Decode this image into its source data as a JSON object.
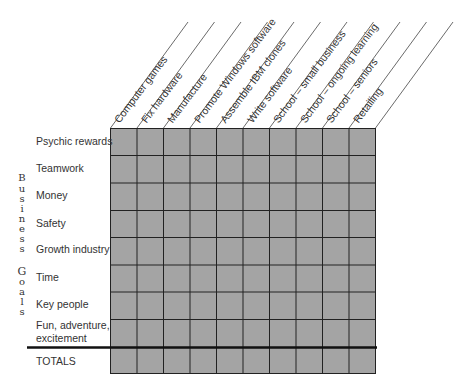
{
  "columns": [
    {
      "label": "Computer games"
    },
    {
      "label": "Fix hardware"
    },
    {
      "label": "Manufacture"
    },
    {
      "label": "Promote Windows software"
    },
    {
      "label": "Assemble IBM clones"
    },
    {
      "label": "Write software"
    },
    {
      "label": "School – small business"
    },
    {
      "label": "School – ongoing learning"
    },
    {
      "label": "School – seniors"
    },
    {
      "label": "Retailing"
    }
  ],
  "rows": [
    {
      "label": "Psychic rewards"
    },
    {
      "label": "Teamwork"
    },
    {
      "label": "Money"
    },
    {
      "label": "Safety"
    },
    {
      "label": "Growth industry"
    },
    {
      "label": "Time"
    },
    {
      "label": "Key people"
    },
    {
      "label": "Fun, adventure,",
      "label2": "excitement"
    },
    {
      "label": "TOTALS"
    }
  ],
  "side_label": {
    "word1": [
      "B",
      "u",
      "s",
      "i",
      "n",
      "e",
      "s",
      "s"
    ],
    "word2": [
      "G",
      "o",
      "a",
      "l",
      "s"
    ]
  },
  "colors": {
    "cell_fill": "#a4a4a4",
    "grid_line": "#222222",
    "diagonal_line": "#444444"
  }
}
